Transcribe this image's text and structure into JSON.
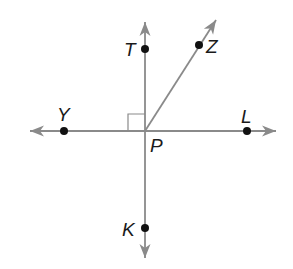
{
  "diagram": {
    "type": "geometry-lines-angles",
    "colors": {
      "line": "#8a8a8a",
      "point": "#111111",
      "label": "#1a1a1a",
      "background": "#ffffff"
    },
    "center": {
      "name": "P",
      "x": 145,
      "y": 131
    },
    "lines": [
      {
        "id": "line-YL",
        "kind": "line",
        "from": [
          30,
          131
        ],
        "to": [
          276,
          131
        ],
        "arrows": "both"
      },
      {
        "id": "line-TK",
        "kind": "line",
        "from": [
          145,
          22
        ],
        "to": [
          145,
          258
        ],
        "arrows": "both"
      }
    ],
    "rays": [
      {
        "id": "ray-PZ",
        "from": [
          145,
          131
        ],
        "to": [
          216,
          20
        ],
        "arrows": "end"
      }
    ],
    "right_angle_marker": {
      "x": 128,
      "y": 114,
      "size": 17,
      "between": [
        "Y",
        "T"
      ]
    },
    "points": [
      {
        "name": "T",
        "x": 145,
        "y": 49,
        "label_x": 124,
        "label_y": 56
      },
      {
        "name": "Z",
        "x": 199,
        "y": 45,
        "label_x": 206,
        "label_y": 53
      },
      {
        "name": "Y",
        "x": 64,
        "y": 131,
        "label_x": 57,
        "label_y": 121
      },
      {
        "name": "L",
        "x": 247,
        "y": 131,
        "label_x": 241,
        "label_y": 123
      },
      {
        "name": "K",
        "x": 145,
        "y": 228,
        "label_x": 122,
        "label_y": 236
      },
      {
        "name": "P",
        "x": 145,
        "y": 131,
        "label_x": 150,
        "label_y": 152,
        "dot": false
      }
    ]
  }
}
